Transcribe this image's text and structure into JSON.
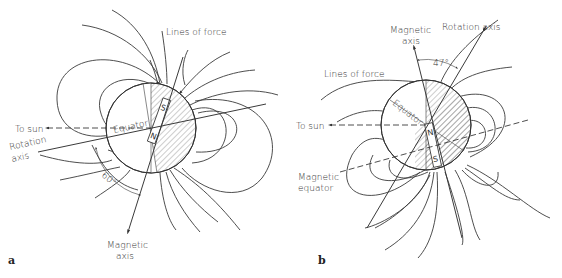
{
  "figure": {
    "panels": [
      {
        "id": "a",
        "panel_label": "a",
        "labels": {
          "lines_of_force": "Lines of force",
          "to_sun": "To sun",
          "equator": "Equator",
          "rotation_axis_line1": "Rotation",
          "rotation_axis_line2": "axis",
          "magnetic_axis_line1": "Magnetic",
          "magnetic_axis_line2": "axis",
          "angle": "60°",
          "north_pole": "N",
          "south_pole": "S"
        }
      },
      {
        "id": "b",
        "panel_label": "b",
        "labels": {
          "magnetic_axis_line1": "Magnetic",
          "magnetic_axis_line2": "axis",
          "rotation_axis": "Rotation axis",
          "angle": "47°",
          "lines_of_force": "Lines of force",
          "equator": "Equator",
          "to_sun": "To sun",
          "magnetic_equator_line1": "Magnetic",
          "magnetic_equator_line2": "equator",
          "north_pole": "N",
          "south_pole": "S"
        }
      }
    ]
  }
}
